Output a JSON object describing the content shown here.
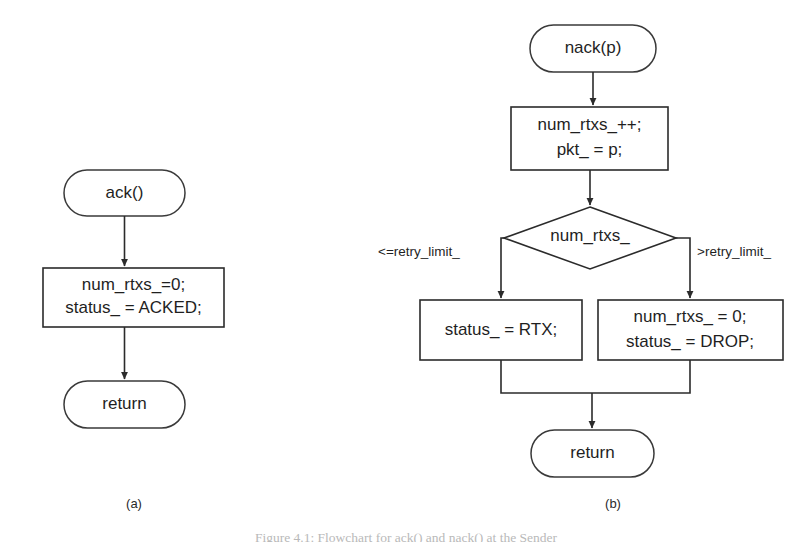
{
  "figure": {
    "caption": "Figure 4.1: Flowchart for ack() and nack() at the Sender",
    "panels": [
      {
        "id": "a",
        "label": "(a)"
      },
      {
        "id": "b",
        "label": "(b)"
      }
    ]
  },
  "panel_a": {
    "start": {
      "text": "ack()"
    },
    "process": {
      "line1": "num_rtxs_=0;",
      "line2": "status_ = ACKED;"
    },
    "end": {
      "text": "return"
    }
  },
  "panel_b": {
    "start": {
      "text": "nack(p)"
    },
    "process": {
      "line1": "num_rtxs_++;",
      "line2": "pkt_ = p;"
    },
    "decision": {
      "text": "num_rtxs_"
    },
    "branch_left_label": "<=retry_limit_",
    "branch_right_label": ">retry_limit_",
    "process_left": {
      "line1": "status_ = RTX;"
    },
    "process_right": {
      "line1": "num_rtxs_ = 0;",
      "line2": "status_ = DROP;"
    },
    "end": {
      "text": "return"
    }
  },
  "colors": {
    "stroke": "#2b2b2b",
    "fill": "#ffffff",
    "text": "#1f1f1f"
  }
}
